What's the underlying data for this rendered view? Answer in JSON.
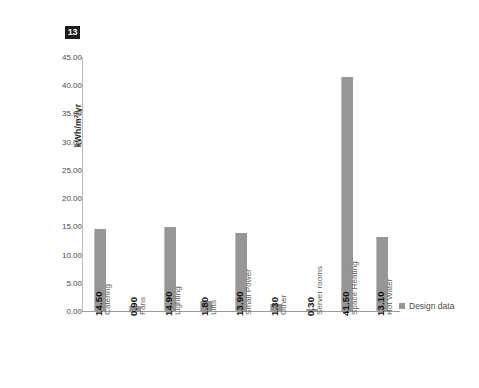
{
  "figure": {
    "number_badge": "13"
  },
  "legend": {
    "position": "right",
    "entries": [
      {
        "label": "Design data",
        "color": "#969696"
      }
    ]
  },
  "chart_data": {
    "type": "bar",
    "title": "",
    "subtitle": "",
    "xlabel": "",
    "ylabel": "kWh/m2/yr",
    "ylabel_parts": {
      "pre": "kWh/m",
      "sup": "2",
      "post": "/yr"
    },
    "categories": [
      "Catering",
      "Fans",
      "Lighting",
      "Lifts",
      "Small Power",
      "Other",
      "Server rooms",
      "Space Heating",
      "Hot Water"
    ],
    "series": [
      {
        "name": "Design data",
        "color": "#969696",
        "values": [
          14.5,
          0.9,
          14.9,
          1.8,
          13.9,
          1.3,
          0.3,
          41.5,
          13.1
        ]
      }
    ],
    "data_labels": [
      "14.50",
      "0.90",
      "14.90",
      "1.80",
      "13.90",
      "1.30",
      "0.30",
      "41.50",
      "13.10"
    ],
    "ylim": [
      0,
      45
    ],
    "ytick_step": 5,
    "ytick_labels": [
      "0.00",
      "5.00",
      "10.00",
      "15.00",
      "20.00",
      "25.00",
      "30.00",
      "35.00",
      "40.00",
      "45.00"
    ],
    "ytick_values": [
      0,
      5,
      10,
      15,
      20,
      25,
      30,
      35,
      40,
      45
    ],
    "grid": false,
    "legend_position": "right",
    "bar_color": "#969696",
    "axis_color": "#9a9a9a",
    "background": "#ffffff"
  }
}
